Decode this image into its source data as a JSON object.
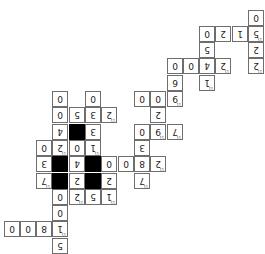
{
  "puzzle": {
    "orientation": "rotated 180 degrees",
    "colors": {
      "cell_bg": "#ffffff",
      "block": "#000000",
      "border": "#6e6e6e",
      "text": "#222222"
    },
    "cells": [
      {
        "row": 0,
        "col": 15,
        "digit": "0"
      },
      {
        "row": 1,
        "col": 12,
        "digit": "0"
      },
      {
        "row": 1,
        "col": 13,
        "digit": "2"
      },
      {
        "row": 1,
        "col": 14,
        "digit": "1"
      },
      {
        "row": 1,
        "col": 15,
        "digit": "5",
        "clue": "11"
      },
      {
        "row": 2,
        "col": 12,
        "digit": "5"
      },
      {
        "row": 2,
        "col": 15,
        "digit": "2"
      },
      {
        "row": 3,
        "col": 10,
        "digit": "0"
      },
      {
        "row": 3,
        "col": 11,
        "digit": "0"
      },
      {
        "row": 3,
        "col": 12,
        "digit": "4"
      },
      {
        "row": 3,
        "col": 13,
        "digit": "2",
        "clue": "11"
      },
      {
        "row": 3,
        "col": 15,
        "digit": "2",
        "clue": "11"
      },
      {
        "row": 4,
        "col": 10,
        "digit": "6"
      },
      {
        "row": 4,
        "col": 12,
        "digit": "1",
        "clue": "11"
      },
      {
        "row": 5,
        "col": 3,
        "digit": "0"
      },
      {
        "row": 5,
        "col": 5,
        "digit": "0"
      },
      {
        "row": 5,
        "col": 8,
        "digit": "0"
      },
      {
        "row": 5,
        "col": 9,
        "digit": "0"
      },
      {
        "row": 5,
        "col": 10,
        "digit": "9",
        "clue": "11"
      },
      {
        "row": 6,
        "col": 3,
        "digit": "0"
      },
      {
        "row": 6,
        "col": 4,
        "digit": "5"
      },
      {
        "row": 6,
        "col": 5,
        "digit": "3"
      },
      {
        "row": 6,
        "col": 6,
        "digit": "2",
        "clue": "11"
      },
      {
        "row": 6,
        "col": 9,
        "digit": "2"
      },
      {
        "row": 7,
        "col": 3,
        "digit": "4"
      },
      {
        "row": 7,
        "col": 4,
        "black": true
      },
      {
        "row": 7,
        "col": 5,
        "digit": "3"
      },
      {
        "row": 7,
        "col": 8,
        "digit": "0"
      },
      {
        "row": 7,
        "col": 9,
        "digit": "9",
        "clue": "11"
      },
      {
        "row": 7,
        "col": 10,
        "digit": "7",
        "clue": "11"
      },
      {
        "row": 8,
        "col": 2,
        "digit": "0"
      },
      {
        "row": 8,
        "col": 3,
        "digit": "2",
        "clue": "11"
      },
      {
        "row": 8,
        "col": 4,
        "digit": "0"
      },
      {
        "row": 8,
        "col": 5,
        "digit": "1",
        "clue": "11"
      },
      {
        "row": 8,
        "col": 8,
        "digit": "3"
      },
      {
        "row": 9,
        "col": 2,
        "digit": "3"
      },
      {
        "row": 9,
        "col": 3,
        "black": true
      },
      {
        "row": 9,
        "col": 4,
        "digit": "4"
      },
      {
        "row": 9,
        "col": 5,
        "black": true
      },
      {
        "row": 9,
        "col": 6,
        "digit": "0"
      },
      {
        "row": 9,
        "col": 7,
        "digit": "0"
      },
      {
        "row": 9,
        "col": 8,
        "digit": "8"
      },
      {
        "row": 9,
        "col": 9,
        "digit": "2",
        "clue": "11"
      },
      {
        "row": 10,
        "col": 2,
        "digit": "7",
        "clue": "11"
      },
      {
        "row": 10,
        "col": 3,
        "black": true
      },
      {
        "row": 10,
        "col": 4,
        "digit": "2"
      },
      {
        "row": 10,
        "col": 5,
        "black": true
      },
      {
        "row": 10,
        "col": 6,
        "digit": "2"
      },
      {
        "row": 10,
        "col": 8,
        "digit": "7",
        "clue": "11"
      },
      {
        "row": 11,
        "col": 3,
        "digit": "0"
      },
      {
        "row": 11,
        "col": 4,
        "digit": "2",
        "clue": "11"
      },
      {
        "row": 11,
        "col": 5,
        "digit": "5"
      },
      {
        "row": 11,
        "col": 6,
        "digit": "1",
        "clue": "11"
      },
      {
        "row": 12,
        "col": 3,
        "digit": "0"
      },
      {
        "row": 13,
        "col": 0,
        "digit": "0"
      },
      {
        "row": 13,
        "col": 1,
        "digit": "0"
      },
      {
        "row": 13,
        "col": 2,
        "digit": "8"
      },
      {
        "row": 13,
        "col": 3,
        "digit": "1",
        "clue": "11"
      },
      {
        "row": 14,
        "col": 3,
        "digit": "5"
      }
    ]
  }
}
